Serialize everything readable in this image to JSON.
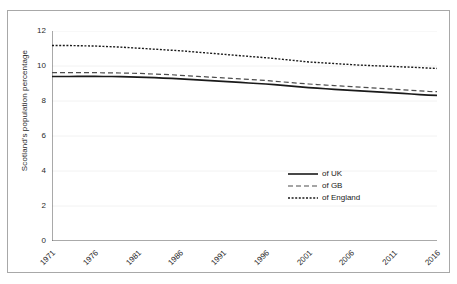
{
  "chart_data": {
    "type": "line",
    "title": "",
    "xlabel": "",
    "ylabel": "Scotland's population percentage",
    "xlim": [
      1971,
      2016
    ],
    "ylim": [
      0,
      12
    ],
    "grid": true,
    "legend_position": "center-right",
    "x": [
      1971,
      1972,
      1973,
      1974,
      1975,
      1976,
      1977,
      1978,
      1979,
      1980,
      1981,
      1982,
      1983,
      1984,
      1985,
      1986,
      1987,
      1988,
      1989,
      1990,
      1991,
      1992,
      1993,
      1994,
      1995,
      1996,
      1997,
      1998,
      1999,
      2000,
      2001,
      2002,
      2003,
      2004,
      2005,
      2006,
      2007,
      2008,
      2009,
      2010,
      2011,
      2012,
      2013,
      2014,
      2015,
      2016
    ],
    "xticks": [
      1971,
      1976,
      1981,
      1986,
      1991,
      1996,
      2001,
      2006,
      2011,
      2016
    ],
    "xticklabels": [
      "1971",
      "1976",
      "1981",
      "1986",
      "1991",
      "1996",
      "2001",
      "2006",
      "2011",
      "2016"
    ],
    "yticks": [
      0,
      2,
      4,
      6,
      8,
      10,
      12
    ],
    "yticklabels": [
      "0",
      "2",
      "4",
      "6",
      "8",
      "10",
      "12"
    ],
    "series": [
      {
        "name": "of UK",
        "style": "solid",
        "color": "#1a1a1a",
        "values": [
          9.4,
          9.4,
          9.4,
          9.41,
          9.41,
          9.41,
          9.4,
          9.4,
          9.39,
          9.38,
          9.37,
          9.35,
          9.33,
          9.31,
          9.29,
          9.27,
          9.24,
          9.21,
          9.18,
          9.15,
          9.12,
          9.09,
          9.06,
          9.03,
          9.0,
          8.97,
          8.93,
          8.89,
          8.85,
          8.81,
          8.77,
          8.73,
          8.7,
          8.67,
          8.64,
          8.61,
          8.58,
          8.55,
          8.52,
          8.49,
          8.46,
          8.43,
          8.4,
          8.37,
          8.34,
          8.32
        ]
      },
      {
        "name": "of GB",
        "style": "dashed",
        "color": "#4d4d4d",
        "values": [
          9.62,
          9.62,
          9.62,
          9.62,
          9.62,
          9.62,
          9.61,
          9.61,
          9.6,
          9.59,
          9.58,
          9.56,
          9.54,
          9.52,
          9.5,
          9.47,
          9.44,
          9.41,
          9.38,
          9.35,
          9.32,
          9.29,
          9.26,
          9.23,
          9.2,
          9.17,
          9.13,
          9.09,
          9.05,
          9.01,
          8.97,
          8.94,
          8.91,
          8.88,
          8.85,
          8.82,
          8.79,
          8.76,
          8.73,
          8.7,
          8.67,
          8.64,
          8.61,
          8.58,
          8.55,
          8.53
        ]
      },
      {
        "name": "of England",
        "style": "dotted",
        "color": "#1a1a1a",
        "values": [
          11.17,
          11.17,
          11.17,
          11.16,
          11.15,
          11.14,
          11.12,
          11.1,
          11.08,
          11.05,
          11.02,
          10.99,
          10.96,
          10.93,
          10.9,
          10.87,
          10.83,
          10.79,
          10.75,
          10.71,
          10.67,
          10.63,
          10.59,
          10.55,
          10.51,
          10.47,
          10.43,
          10.38,
          10.33,
          10.28,
          10.23,
          10.2,
          10.17,
          10.14,
          10.11,
          10.08,
          10.05,
          10.03,
          10.01,
          9.99,
          9.97,
          9.95,
          9.93,
          9.91,
          9.88,
          9.86
        ]
      }
    ]
  },
  "legend": {
    "items": [
      {
        "label": "of UK"
      },
      {
        "label": "of GB"
      },
      {
        "label": "of England"
      }
    ]
  },
  "colors": {
    "axis": "#555555",
    "grid": "#f2f2f2",
    "frame": "#a8a8a8",
    "text": "#2b2b2b",
    "background": "#ffffff"
  }
}
